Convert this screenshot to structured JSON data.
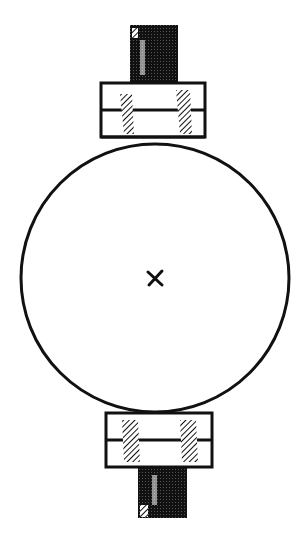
{
  "diagram": {
    "colors": {
      "ink": "#111111",
      "background": "#ffffff"
    },
    "center_mark": "×",
    "circle": {
      "cx": 155,
      "cy": 278,
      "r": 134
    },
    "top_clamp": {
      "x": 101,
      "y": 83,
      "width": 104,
      "height": 54,
      "divider_y": 110
    },
    "bottom_clamp": {
      "x": 106,
      "y": 413,
      "width": 106,
      "height": 54,
      "divider_y": 440
    },
    "top_post": {
      "x": 130,
      "y": 25,
      "width": 48,
      "height": 58
    },
    "bottom_post": {
      "x": 138,
      "y": 467,
      "width": 49,
      "height": 51
    }
  }
}
